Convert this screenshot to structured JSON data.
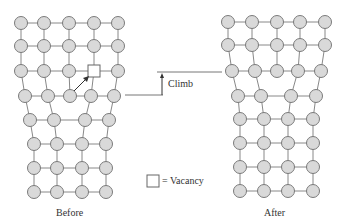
{
  "labels": {
    "before": "Before",
    "after": "After",
    "climb": "Climb",
    "legend": "= Vacancy"
  },
  "colors": {
    "atom_fill": "#d9d9d9",
    "atom_stroke": "#7a7a7a",
    "line": "#888888",
    "text": "#333333"
  },
  "before_rows": [
    {
      "y": 23,
      "x": [
        21,
        44,
        69,
        94,
        118
      ]
    },
    {
      "y": 46,
      "x": [
        21,
        44,
        69,
        94,
        118
      ]
    },
    {
      "y": 71,
      "x": [
        21,
        44,
        69,
        null,
        118
      ]
    },
    {
      "y": 96,
      "x": [
        25,
        48,
        70,
        91,
        114
      ]
    },
    {
      "y": 120,
      "x": [
        30,
        54,
        85,
        109
      ]
    },
    {
      "y": 144,
      "x": [
        34,
        57,
        82,
        106
      ]
    },
    {
      "y": 168,
      "x": [
        34,
        57,
        82,
        106
      ]
    },
    {
      "y": 192,
      "x": [
        34,
        57,
        82,
        106
      ]
    }
  ],
  "after_rows": [
    {
      "y": 22,
      "x": [
        228,
        252,
        277,
        300,
        325
      ]
    },
    {
      "y": 45,
      "x": [
        228,
        252,
        277,
        300,
        325
      ]
    },
    {
      "y": 71,
      "x": [
        232,
        255,
        277,
        298,
        321
      ]
    },
    {
      "y": 96,
      "x": [
        238,
        261,
        291,
        316
      ]
    },
    {
      "y": 119,
      "x": [
        240,
        264,
        288,
        313
      ]
    },
    {
      "y": 143,
      "x": [
        240,
        264,
        288,
        313
      ]
    },
    {
      "y": 167,
      "x": [
        240,
        264,
        288,
        313
      ]
    },
    {
      "y": 191,
      "x": [
        240,
        264,
        288,
        313
      ]
    }
  ],
  "vacancy": {
    "x": 88,
    "y": 65,
    "size": 12
  }
}
